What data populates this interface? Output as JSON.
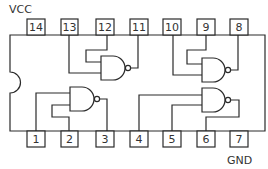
{
  "diagram": {
    "type": "IC pinout - quad 2-input NAND gate, 14-pin DIP",
    "labels": {
      "power": "VCC",
      "ground": "GND"
    },
    "colors": {
      "stroke": "#2a2a2a",
      "text": "#333333",
      "background": "#ffffff"
    },
    "top_pins": [
      {
        "number": "14",
        "function": "VCC"
      },
      {
        "number": "13",
        "function": "gate A input"
      },
      {
        "number": "12",
        "function": "gate A input"
      },
      {
        "number": "11",
        "function": "gate A output"
      },
      {
        "number": "10",
        "function": "gate B input"
      },
      {
        "number": "9",
        "function": "gate B input"
      },
      {
        "number": "8",
        "function": "gate B output"
      }
    ],
    "bottom_pins": [
      {
        "number": "1",
        "function": "gate C input"
      },
      {
        "number": "2",
        "function": "gate C input"
      },
      {
        "number": "3",
        "function": "gate C output"
      },
      {
        "number": "4",
        "function": "gate D input"
      },
      {
        "number": "5",
        "function": "gate D input"
      },
      {
        "number": "6",
        "function": "gate D output"
      },
      {
        "number": "7",
        "function": "GND"
      }
    ],
    "gates": [
      {
        "name": "nand-gate-top-left",
        "inputs": [
          "13",
          "12"
        ],
        "output": "11"
      },
      {
        "name": "nand-gate-top-right",
        "inputs": [
          "10",
          "9"
        ],
        "output": "8"
      },
      {
        "name": "nand-gate-bottom-left",
        "inputs": [
          "1",
          "2"
        ],
        "output": "3"
      },
      {
        "name": "nand-gate-bottom-right",
        "inputs": [
          "4",
          "5"
        ],
        "output": "6"
      }
    ]
  }
}
